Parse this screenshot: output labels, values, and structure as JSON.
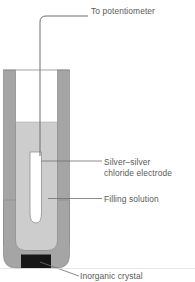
{
  "figure": {
    "kind": "science-diagram",
    "background_color": "#ffffff",
    "line_color": "#5a5a5a",
    "text_color": "#5a5a5a"
  },
  "labels": {
    "potentiometer": "To potentiometer",
    "electrode_line1": "Silver–silver",
    "electrode_line2": "chloride electrode",
    "filling_solution": "Filling solution",
    "inorganic_crystal": "Inorganic crystal"
  },
  "parts": {
    "lead_wire": {
      "name": "lead-wire",
      "color": "#6e6e6e"
    },
    "body_wall": {
      "name": "electrode-body-wall",
      "color": "#a0a0a0"
    },
    "body_interior": {
      "name": "electrode-body-interior",
      "color": "#ffffff"
    },
    "filling_solution": {
      "name": "filling-solution",
      "color": "#cdcdcd"
    },
    "inner_electrode": {
      "name": "silver-silver-chloride-electrode",
      "color": "#ffffff"
    },
    "inorganic_crystal": {
      "name": "inorganic-crystal",
      "color": "#1a1a1a"
    }
  }
}
